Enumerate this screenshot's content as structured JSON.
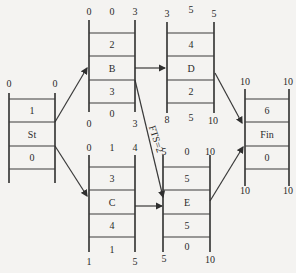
{
  "diagram": {
    "type": "precedence network (activity-on-node, ladder nodes)",
    "nodes": [
      {
        "id": "St",
        "label": "St",
        "duration": "1",
        "float_mid": "0",
        "top_left": "0",
        "top_mid": "",
        "top_right": "0",
        "bottom_left": "",
        "bottom_mid": "",
        "bottom_right": ""
      },
      {
        "id": "B",
        "label": "B",
        "duration": "2",
        "float_mid": "3",
        "top_left": "0",
        "top_mid": "0",
        "top_right": "3",
        "bottom_left": "0",
        "bottom_mid": "0",
        "bottom_right": "3"
      },
      {
        "id": "C",
        "label": "C",
        "duration": "3",
        "float_mid": "4",
        "top_left": "0",
        "top_mid": "1",
        "top_right": "4",
        "bottom_left": "1",
        "bottom_mid": "1",
        "bottom_right": "5"
      },
      {
        "id": "D",
        "label": "D",
        "duration": "4",
        "float_mid": "2",
        "top_left": "3",
        "top_mid": "5",
        "top_right": "5",
        "bottom_left": "8",
        "bottom_mid": "5",
        "bottom_right": "10"
      },
      {
        "id": "E",
        "label": "E",
        "duration": "5",
        "float_mid": "5",
        "top_left": "5",
        "top_mid": "0",
        "top_right": "10",
        "bottom_left": "5",
        "bottom_mid": "0",
        "bottom_right": "10"
      },
      {
        "id": "Fin",
        "label": "Fin",
        "duration": "6",
        "float_mid": "0",
        "top_left": "10",
        "top_mid": "",
        "top_right": "10",
        "bottom_left": "10",
        "bottom_mid": "",
        "bottom_right": "10"
      }
    ],
    "edges": [
      {
        "from": "St",
        "to": "B",
        "label": ""
      },
      {
        "from": "St",
        "to": "C",
        "label": ""
      },
      {
        "from": "B",
        "to": "D",
        "label": ""
      },
      {
        "from": "B",
        "to": "E",
        "label": "FTS=2"
      },
      {
        "from": "C",
        "to": "E",
        "label": ""
      },
      {
        "from": "D",
        "to": "Fin",
        "label": ""
      },
      {
        "from": "E",
        "to": "Fin",
        "label": ""
      }
    ]
  }
}
